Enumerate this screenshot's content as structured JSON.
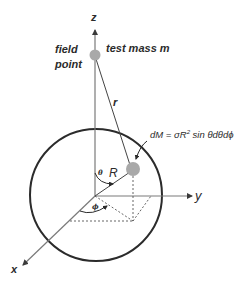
{
  "diagram": {
    "axes": {
      "z_label": "z",
      "y_label": "y",
      "x_label": "x"
    },
    "labels": {
      "field_point_line1": "field",
      "field_point_line2": "point",
      "test_mass": "test mass m",
      "r": "r",
      "R": "R",
      "theta": "θ",
      "phi": "ϕ"
    },
    "formula": {
      "lhs": "dM = σR",
      "exp": "2",
      "rhs": " sin θdθdϕ"
    },
    "colors": {
      "line": "#2b2b2b",
      "axis": "#6b6b6b",
      "mass_fill": "#a9a9a9",
      "dashed": "#555555"
    }
  }
}
